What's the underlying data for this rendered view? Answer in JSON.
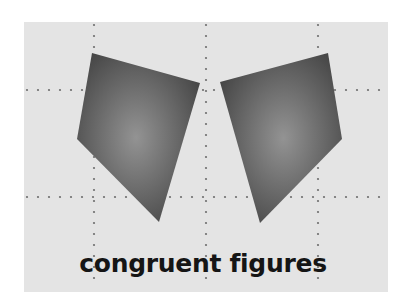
{
  "diagram": {
    "title": "congruent figures",
    "colors": {
      "panel": "#e4e4e4",
      "dots": "#6e6e6e",
      "shape_center": "#939393",
      "shape_edge": "#474747",
      "text": "#151515"
    },
    "figures": [
      {
        "name": "left-quadrilateral",
        "sides": 4
      },
      {
        "name": "right-quadrilateral",
        "sides": 4,
        "relation": "mirror image of left-quadrilateral"
      }
    ],
    "grid": {
      "vertical_lines": 3,
      "horizontal_lines": 2,
      "style": "dotted"
    }
  }
}
